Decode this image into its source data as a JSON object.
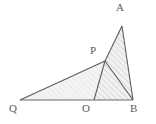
{
  "figure": {
    "background_color": "#ffffff",
    "stroke_color": "#595959",
    "label_color": "#5a5a5a",
    "hatch_color": "#9a9a9a",
    "fill_color": "#f2f2f2"
  },
  "points": [
    {
      "name": "A",
      "label": "A",
      "x": 122,
      "y": 26,
      "label_x": 116,
      "label_y": 2
    },
    {
      "name": "P",
      "label": "P",
      "x": 105,
      "y": 61,
      "label_x": 90,
      "label_y": 45
    },
    {
      "name": "Q",
      "label": "Q",
      "x": 20,
      "y": 100,
      "label_x": 9,
      "label_y": 103
    },
    {
      "name": "O",
      "label": "O",
      "x": 94,
      "y": 100,
      "label_x": 82,
      "label_y": 103
    },
    {
      "name": "B",
      "label": "B",
      "x": 133,
      "y": 100,
      "label_x": 130,
      "label_y": 103
    }
  ],
  "segments": [
    {
      "name": "segment-QB",
      "from": "Q",
      "to": "B"
    },
    {
      "name": "segment-QP",
      "from": "Q",
      "to": "P"
    },
    {
      "name": "segment-PA",
      "from": "P",
      "to": "A"
    },
    {
      "name": "segment-AB",
      "from": "A",
      "to": "B"
    },
    {
      "name": "segment-PB",
      "from": "P",
      "to": "B"
    },
    {
      "name": "segment-PO",
      "from": "P",
      "to": "O"
    }
  ],
  "regions": [
    {
      "name": "triangle-QPB",
      "vertices": "Q,P,B",
      "shading": "light"
    },
    {
      "name": "triangle-PAB",
      "vertices": "P,A,B",
      "shading": "hatched"
    },
    {
      "name": "triangle-POB",
      "vertices": "P,O,B",
      "shading": "hatched"
    }
  ]
}
